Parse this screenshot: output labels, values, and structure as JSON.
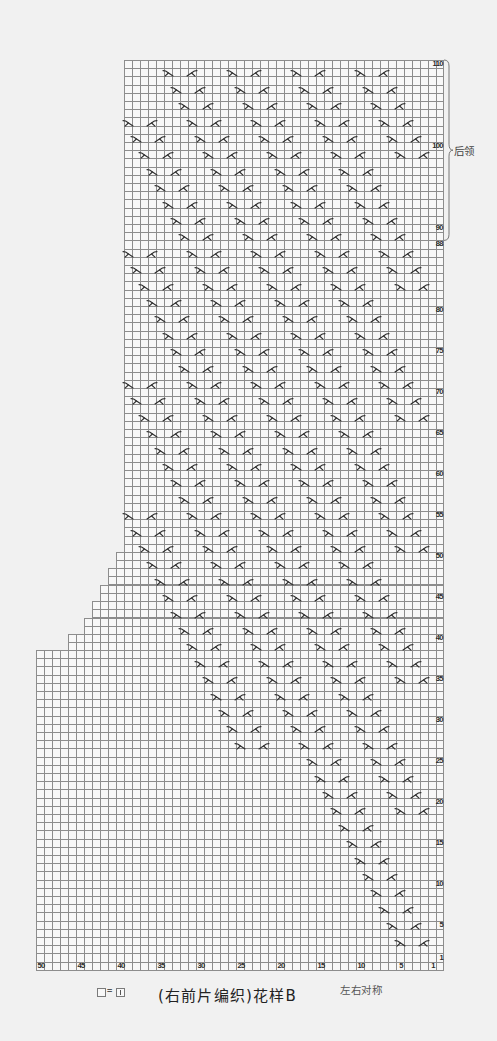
{
  "chart": {
    "title": "(右前片编织)花样B",
    "symmetry_note": "左右对称",
    "legend": {
      "lhs": "blank-cell",
      "equals": "=",
      "rhs": "knit-stitch"
    },
    "total_rows": 110,
    "total_cols": 50,
    "row_labels": [
      110,
      100,
      90,
      88,
      80,
      75,
      70,
      65,
      60,
      55,
      50,
      45,
      40,
      35,
      30,
      25,
      20,
      15,
      10,
      5,
      1
    ],
    "col_labels": [
      50,
      45,
      40,
      35,
      30,
      25,
      20,
      15,
      10,
      5,
      1
    ],
    "shape": [
      {
        "top_row": 110,
        "bottom_row": 51,
        "left_col": 39
      },
      {
        "top_row": 50,
        "bottom_row": 49,
        "left_col": 40
      },
      {
        "top_row": 48,
        "bottom_row": 47,
        "left_col": 41
      },
      {
        "top_row": 46,
        "bottom_row": 45,
        "left_col": 42
      },
      {
        "top_row": 44,
        "bottom_row": 43,
        "left_col": 43
      },
      {
        "top_row": 42,
        "bottom_row": 41,
        "left_col": 44
      },
      {
        "top_row": 40,
        "bottom_row": 39,
        "left_col": 46
      },
      {
        "top_row": 38,
        "bottom_row": 1,
        "left_col": 50
      }
    ],
    "bracket": {
      "label": "后领",
      "top_row": 110,
      "bottom_row": 89
    },
    "symbol_types": {
      "a": "right-cross-icon",
      "b": "left-cross-icon"
    },
    "symbol_rows": [
      {
        "row": 109,
        "a": [
          34,
          26,
          18,
          10
        ],
        "b": [
          31,
          23,
          15,
          7
        ]
      },
      {
        "row": 107,
        "a": [
          33,
          25,
          17,
          9
        ],
        "b": [
          30,
          22,
          14,
          6
        ]
      },
      {
        "row": 105,
        "a": [
          32,
          24,
          16,
          8
        ],
        "b": [
          29,
          21,
          13,
          5
        ]
      },
      {
        "row": 103,
        "a": [
          39,
          31,
          23,
          15,
          7
        ],
        "b": [
          36,
          28,
          20,
          12,
          4
        ]
      },
      {
        "row": 101,
        "a": [
          38,
          30,
          22,
          14,
          6
        ],
        "b": [
          35,
          27,
          19,
          11,
          3
        ]
      },
      {
        "row": 99,
        "a": [
          37,
          29,
          21,
          13,
          5
        ],
        "b": [
          34,
          26,
          18,
          10,
          2
        ]
      },
      {
        "row": 97,
        "a": [
          36,
          28,
          20,
          12
        ],
        "b": [
          33,
          25,
          17,
          9
        ]
      },
      {
        "row": 95,
        "a": [
          35,
          27,
          19,
          11
        ],
        "b": [
          32,
          24,
          16,
          8
        ]
      },
      {
        "row": 93,
        "a": [
          34,
          26,
          18,
          10
        ],
        "b": [
          31,
          23,
          15,
          7
        ]
      },
      {
        "row": 91,
        "a": [
          33,
          25,
          17,
          9
        ],
        "b": [
          30,
          22,
          14,
          6
        ]
      },
      {
        "row": 89,
        "a": [
          32,
          24,
          16,
          8
        ],
        "b": [
          29,
          21,
          13,
          5
        ]
      },
      {
        "row": 87,
        "a": [
          39,
          31,
          23,
          15,
          7
        ],
        "b": [
          36,
          28,
          20,
          12,
          4
        ]
      },
      {
        "row": 85,
        "a": [
          38,
          30,
          22,
          14,
          6
        ],
        "b": [
          35,
          27,
          19,
          11,
          3
        ]
      },
      {
        "row": 83,
        "a": [
          37,
          29,
          21,
          13,
          5
        ],
        "b": [
          34,
          26,
          18,
          10,
          2
        ]
      },
      {
        "row": 81,
        "a": [
          36,
          28,
          20,
          12
        ],
        "b": [
          33,
          25,
          17,
          9
        ]
      },
      {
        "row": 79,
        "a": [
          35,
          27,
          19,
          11
        ],
        "b": [
          32,
          24,
          16,
          8
        ]
      },
      {
        "row": 77,
        "a": [
          34,
          26,
          18,
          10
        ],
        "b": [
          31,
          23,
          15,
          7
        ]
      },
      {
        "row": 75,
        "a": [
          33,
          25,
          17,
          9
        ],
        "b": [
          30,
          22,
          14,
          6
        ]
      },
      {
        "row": 73,
        "a": [
          32,
          24,
          16,
          8
        ],
        "b": [
          29,
          21,
          13,
          5
        ]
      },
      {
        "row": 71,
        "a": [
          39,
          31,
          23,
          15,
          7
        ],
        "b": [
          36,
          28,
          20,
          12,
          4
        ]
      },
      {
        "row": 69,
        "a": [
          38,
          30,
          22,
          14,
          6
        ],
        "b": [
          35,
          27,
          19,
          11,
          3
        ]
      },
      {
        "row": 67,
        "a": [
          37,
          29,
          21,
          13,
          5
        ],
        "b": [
          34,
          26,
          18,
          10,
          2
        ]
      },
      {
        "row": 65,
        "a": [
          36,
          28,
          20,
          12
        ],
        "b": [
          33,
          25,
          17,
          9
        ]
      },
      {
        "row": 63,
        "a": [
          35,
          27,
          19,
          11
        ],
        "b": [
          32,
          24,
          16,
          8
        ]
      },
      {
        "row": 61,
        "a": [
          34,
          26,
          18,
          10
        ],
        "b": [
          31,
          23,
          15,
          7
        ]
      },
      {
        "row": 59,
        "a": [
          33,
          25,
          17,
          9
        ],
        "b": [
          30,
          22,
          14,
          6
        ]
      },
      {
        "row": 57,
        "a": [
          32,
          24,
          16,
          8
        ],
        "b": [
          29,
          21,
          13,
          5
        ]
      },
      {
        "row": 55,
        "a": [
          39,
          31,
          23,
          15,
          7
        ],
        "b": [
          36,
          28,
          20,
          12,
          4
        ]
      },
      {
        "row": 53,
        "a": [
          38,
          30,
          22,
          14,
          6
        ],
        "b": [
          35,
          27,
          19,
          11,
          3
        ]
      },
      {
        "row": 51,
        "a": [
          37,
          29,
          21,
          13,
          5
        ],
        "b": [
          34,
          26,
          18,
          10,
          2
        ]
      },
      {
        "row": 49,
        "a": [
          36,
          28,
          20,
          12
        ],
        "b": [
          33,
          25,
          17,
          9
        ]
      },
      {
        "row": 47,
        "a": [
          35,
          27,
          19,
          11
        ],
        "b": [
          32,
          24,
          16,
          8
        ]
      },
      {
        "row": 45,
        "a": [
          34,
          26,
          18,
          10
        ],
        "b": [
          31,
          23,
          15,
          7
        ]
      },
      {
        "row": 43,
        "a": [
          33,
          25,
          17,
          9
        ],
        "b": [
          30,
          22,
          14,
          6
        ]
      },
      {
        "row": 41,
        "a": [
          32,
          24,
          16,
          8
        ],
        "b": [
          29,
          21,
          13,
          5
        ]
      },
      {
        "row": 39,
        "a": [
          31,
          23,
          15,
          7
        ],
        "b": [
          28,
          20,
          12,
          4
        ]
      },
      {
        "row": 37,
        "a": [
          30,
          22,
          14,
          6
        ],
        "b": [
          27,
          19,
          11,
          3
        ]
      },
      {
        "row": 35,
        "a": [
          29,
          21,
          13,
          5
        ],
        "b": [
          26,
          18,
          10,
          2
        ]
      },
      {
        "row": 33,
        "a": [
          28,
          20,
          12
        ],
        "b": [
          25,
          17,
          9
        ]
      },
      {
        "row": 31,
        "a": [
          27,
          19,
          11
        ],
        "b": [
          24,
          16,
          8
        ]
      },
      {
        "row": 29,
        "a": [
          26,
          18,
          10
        ],
        "b": [
          23,
          15,
          7
        ]
      },
      {
        "row": 27,
        "a": [
          25,
          17,
          9
        ],
        "b": [
          22,
          14,
          6
        ]
      },
      {
        "row": 25,
        "a": [
          16,
          8
        ],
        "b": [
          13,
          5
        ]
      },
      {
        "row": 23,
        "a": [
          15,
          7
        ],
        "b": [
          12,
          4
        ]
      },
      {
        "row": 21,
        "a": [
          14,
          6
        ],
        "b": [
          11,
          3
        ]
      },
      {
        "row": 19,
        "a": [
          13,
          5
        ],
        "b": [
          10,
          2
        ]
      },
      {
        "row": 17,
        "a": [
          12
        ],
        "b": [
          9
        ]
      },
      {
        "row": 15,
        "a": [
          11
        ],
        "b": [
          8
        ]
      },
      {
        "row": 13,
        "a": [
          10
        ],
        "b": [
          7
        ]
      },
      {
        "row": 11,
        "a": [
          9
        ],
        "b": [
          6
        ]
      },
      {
        "row": 9,
        "a": [
          8
        ],
        "b": [
          5
        ]
      },
      {
        "row": 7,
        "a": [
          7
        ],
        "b": [
          4
        ]
      },
      {
        "row": 5,
        "a": [
          6
        ],
        "b": [
          3
        ]
      },
      {
        "row": 3,
        "a": [
          5
        ],
        "b": [
          2
        ]
      }
    ]
  }
}
